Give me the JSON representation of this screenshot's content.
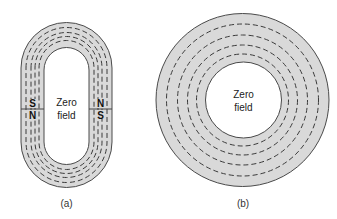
{
  "figure_a": {
    "caption": "(a)",
    "center_label_line1": "Zero",
    "center_label_line2": "field",
    "left_magnet": {
      "top_pole": "S",
      "bottom_pole": "N"
    },
    "right_magnet": {
      "top_pole": "N",
      "bottom_pole": "S"
    }
  },
  "figure_b": {
    "caption": "(b)",
    "center_label_line1": "Zero",
    "center_label_line2": "field"
  },
  "colors": {
    "ring_fill": "#d9d9d9",
    "outline": "#4a4a4a",
    "dash": "#3a3a3a",
    "background": "#ffffff"
  }
}
